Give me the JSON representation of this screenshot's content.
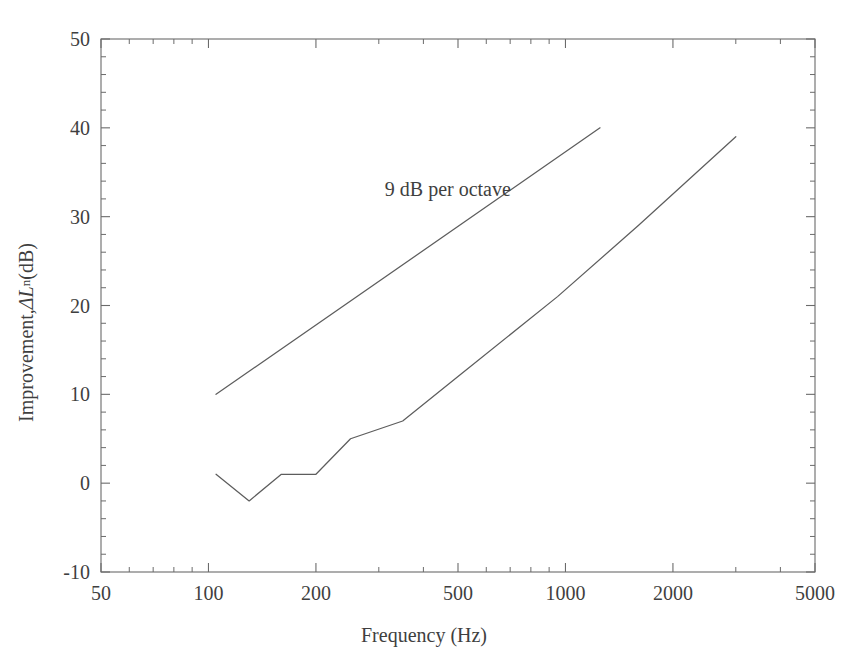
{
  "chart_data": {
    "type": "line",
    "title": "",
    "xlabel": "Frequency (Hz)",
    "ylabel_plain": "Improvement, ΔLn (dB)",
    "ylabel_prefix": "Improvement, ",
    "ylabel_symbol": "ΔL",
    "ylabel_subscript": "n",
    "ylabel_unit": " (dB)",
    "xscale": "log",
    "yscale": "linear",
    "xlim": [
      50,
      5000
    ],
    "ylim": [
      -10,
      50
    ],
    "grid": false,
    "legend_position": "none",
    "x_tick_labels": [
      "50",
      "100",
      "200",
      "500",
      "1000",
      "2000",
      "5000"
    ],
    "x_tick_values": [
      50,
      100,
      200,
      500,
      1000,
      2000,
      5000
    ],
    "y_tick_labels": [
      "-10",
      "0",
      "10",
      "20",
      "30",
      "40",
      "50"
    ],
    "y_tick_values": [
      -10,
      0,
      10,
      20,
      30,
      40,
      50
    ],
    "y_minor_step": 2,
    "annotations": [
      {
        "text": "9 dB per octave",
        "x": 300,
        "y": 33
      }
    ],
    "series": [
      {
        "name": "measured improvement",
        "style": "solid",
        "color": "#5d5d5d",
        "x": [
          105,
          130,
          160,
          200,
          250,
          350,
          500,
          950,
          1600,
          3000
        ],
        "y": [
          1,
          -2,
          1,
          1,
          5,
          7,
          12,
          21,
          29,
          39
        ]
      },
      {
        "name": "9 dB per octave reference",
        "style": "solid",
        "color": "#5d5d5d",
        "x": [
          105,
          1250
        ],
        "y": [
          10,
          40
        ]
      }
    ]
  },
  "axes": {
    "x_title": "Frequency (Hz)",
    "y_title_text": "Improvement, ΔLn (dB)"
  },
  "colors": {
    "background": "#ffffff",
    "axis": "#6b6b6b",
    "curve": "#5d5d5d",
    "text": "#3f3f3f"
  }
}
